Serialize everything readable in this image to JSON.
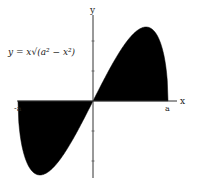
{
  "chart_data": {
    "type": "area",
    "title": "",
    "equation_label": "y = x√(a² − x²)",
    "function": "y = x*sqrt(a^2 - x^2)",
    "xlabel": "x",
    "ylabel": "y",
    "x_tick_labels": [
      "-a",
      "a"
    ],
    "domain": [
      "-a",
      "a"
    ],
    "a": 1,
    "x": [
      -1,
      -0.9,
      -0.8,
      -0.7071,
      -0.6,
      -0.5,
      -0.4,
      -0.3,
      -0.2,
      -0.1,
      0,
      0.1,
      0.2,
      0.3,
      0.4,
      0.5,
      0.6,
      0.7071,
      0.8,
      0.9,
      1
    ],
    "y": [
      0,
      -0.392,
      -0.48,
      -0.5,
      -0.48,
      -0.433,
      -0.367,
      -0.286,
      -0.196,
      -0.099,
      0,
      0.099,
      0.196,
      0.286,
      0.367,
      0.433,
      0.48,
      0.5,
      0.48,
      0.392,
      0
    ],
    "fill": "region between curve and x-axis shaded black",
    "extrema": {
      "max": [
        "a/√2",
        "a²/2"
      ],
      "min": [
        "-a/√2",
        "-a²/2"
      ]
    },
    "grid": false,
    "legend": "none",
    "colors": {
      "fill": "#000000",
      "axis": "#333333",
      "background": "#ffffff"
    }
  }
}
